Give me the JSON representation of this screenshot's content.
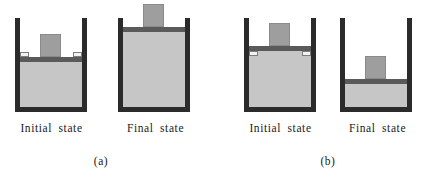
{
  "figure": {
    "background_color": "#ffffff",
    "colors": {
      "wall": "#2b2b2b",
      "gas": "#c6c6c6",
      "block": "#9e9e9e",
      "piston": "#5a5a5a",
      "latch": "#f2f2f2",
      "text": "#1a1a1a"
    }
  },
  "panels": [
    {
      "caption": "(a)",
      "process": "expansion",
      "diagrams": [
        {
          "label": "Initial state",
          "role": "initial",
          "gas_fill_fraction": 0.5,
          "piston_position": "mid",
          "block_position": "on-piston",
          "latches_visible": true,
          "block_inside_cylinder": true
        },
        {
          "label": "Final state",
          "role": "final",
          "gas_fill_fraction": 1.0,
          "piston_position": "top",
          "block_position": "above-rim",
          "latches_visible": false,
          "block_inside_cylinder": false
        }
      ]
    },
    {
      "caption": "(b)",
      "process": "compression",
      "diagrams": [
        {
          "label": "Initial state",
          "role": "initial",
          "gas_fill_fraction": 0.62,
          "piston_position": "mid",
          "block_position": "on-piston",
          "latches_visible": true,
          "block_inside_cylinder": true
        },
        {
          "label": "Final state",
          "role": "final",
          "gas_fill_fraction": 0.26,
          "piston_position": "low",
          "block_position": "on-piston",
          "latches_visible": false,
          "block_inside_cylinder": true
        }
      ]
    }
  ]
}
